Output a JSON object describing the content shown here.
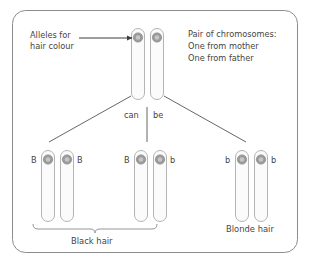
{
  "figure": {
    "frame_color": "#8c8c8c",
    "chromosome_outline_color": "#b4b4b4",
    "chromosome_fill_color": "#fbfbfb",
    "centromere_color": "#9a9a9a",
    "line_color": "#555555",
    "text_color": "#444444"
  },
  "annotations": {
    "alleles_label_line1": "Alleles for",
    "alleles_label_line2": "hair colour",
    "pair_note_line1": "Pair of chromosomes:",
    "pair_note_line2": "One from mother",
    "pair_note_line3": "One from father",
    "can_label": "can",
    "be_label": "be"
  },
  "parent": {
    "name": "parent-chromosome-pair",
    "alleles": [
      "B",
      "b"
    ],
    "source": [
      "mother",
      "father"
    ]
  },
  "offspring": [
    {
      "name": "offspring-bb-homozygous-dominant",
      "left_allele": "B",
      "right_allele": "B",
      "phenotype": "Black hair"
    },
    {
      "name": "offspring-bb-heterozygous",
      "left_allele": "B",
      "right_allele": "b",
      "phenotype": "Black hair"
    },
    {
      "name": "offspring-bb-homozygous-recessive",
      "left_allele": "b",
      "right_allele": "b",
      "phenotype": "Blonde hair"
    }
  ],
  "phenotype_labels": {
    "black_hair": "Black hair",
    "blonde_hair": "Blonde hair"
  }
}
